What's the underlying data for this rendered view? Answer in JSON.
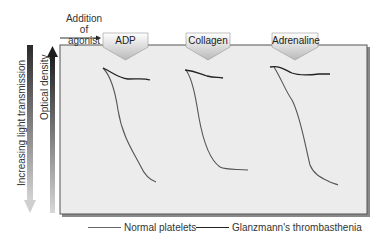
{
  "annotation": {
    "addition_line1": "Addition",
    "addition_line2": "of agonist"
  },
  "agonists": [
    {
      "label": "ADP"
    },
    {
      "label": "Collagen"
    },
    {
      "label": "Adrenaline"
    }
  ],
  "axes": {
    "left_label": "Increasing light transmission",
    "inner_label": "Optical density"
  },
  "legend": {
    "normal": "Normal platelets",
    "glanzmann": "Glanzmann's thrombasthenia"
  },
  "colors": {
    "panel_bg": "#ececec",
    "panel_border": "#555555",
    "normal_curve": "#555555",
    "glanzmann_curve": "#222222"
  }
}
